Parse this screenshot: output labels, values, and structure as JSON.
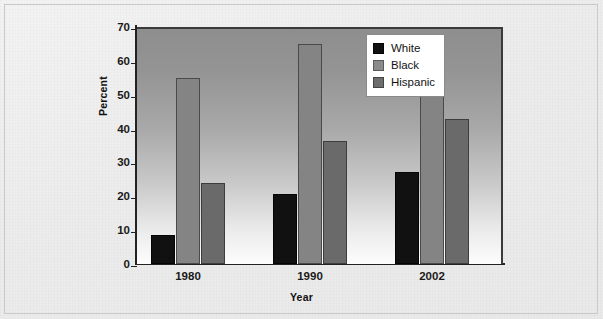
{
  "chart_data": {
    "type": "bar",
    "title": "",
    "subtitle": "",
    "xlabel": "Year",
    "ylabel": "Percent",
    "categories": [
      "1980",
      "1990",
      "2002"
    ],
    "series": [
      {
        "name": "White",
        "values": [
          8.7,
          20.6,
          27.3
        ],
        "color": "#111111"
      },
      {
        "name": "Black",
        "values": [
          55.0,
          65.0,
          67.8
        ],
        "color": "#848484"
      },
      {
        "name": "Hispanic",
        "values": [
          24.0,
          36.3,
          42.7
        ],
        "color": "#6a6a6a"
      }
    ],
    "ylim": [
      0,
      70
    ],
    "yticks": [
      0,
      10,
      20,
      30,
      40,
      50,
      60,
      70
    ],
    "ytick_labels": [
      "0",
      "10",
      "20",
      "30",
      "40",
      "50",
      "60",
      "70"
    ],
    "grid": false,
    "legend_position": "top-right",
    "legend_entries": [
      "White",
      "Black",
      "Hispanic"
    ],
    "annotations": []
  },
  "axes": {
    "y_title": "Percent",
    "x_title": "Year",
    "y_tick_labels": [
      "70",
      "60",
      "50",
      "40",
      "30",
      "20",
      "10",
      "0"
    ],
    "x_tick_labels": [
      "1980",
      "1990",
      "2002"
    ]
  },
  "legend": {
    "items": [
      {
        "label": "White",
        "swatch": "legend-swatch-white"
      },
      {
        "label": "Black",
        "swatch": "legend-swatch-black"
      },
      {
        "label": "Hispanic",
        "swatch": "legend-swatch-hispanic"
      }
    ]
  },
  "style": {
    "plot_bg_top": "#8e8e8e",
    "plot_bg_bottom": "#fdfdfd",
    "page_bg": "#ececec",
    "axis_color": "#222222",
    "series_white": "#111111",
    "series_black": "#848484",
    "series_hispanic": "#6a6a6a"
  }
}
